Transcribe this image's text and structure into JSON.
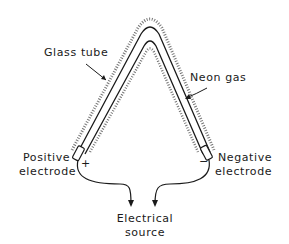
{
  "diagram": {
    "labels": {
      "glass_tube": "Glass tube",
      "neon_gas": "Neon gas",
      "positive_electrode_line1": "Positive",
      "positive_electrode_line2": "electrode",
      "negative_electrode_line1": "Negative",
      "negative_electrode_line2": "electrode",
      "electrical_source_line1": "Electrical",
      "electrical_source_line2": "source"
    },
    "symbols": {
      "positive": "+",
      "negative": "−"
    },
    "colors": {
      "ink": "#1a1a1a",
      "background": "#ffffff"
    }
  }
}
